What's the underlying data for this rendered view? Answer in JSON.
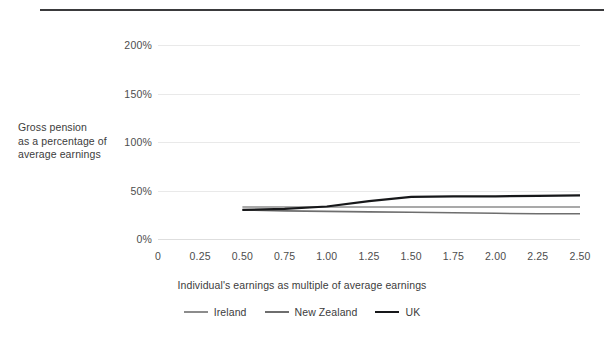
{
  "chart_data": {
    "type": "line",
    "title": "",
    "xlabel": "Individual's earnings as multiple of average earnings",
    "ylabel": "Gross pension as a percentage of average earnings",
    "xlim": [
      0,
      2.5
    ],
    "ylim": [
      0,
      200
    ],
    "x_ticks": [
      "0",
      "0.25",
      "0.50",
      "0.75",
      "1.00",
      "1.25",
      "1.50",
      "1.75",
      "2.00",
      "2.25",
      "2.50"
    ],
    "x_tick_values": [
      0,
      0.25,
      0.5,
      0.75,
      1.0,
      1.25,
      1.5,
      1.75,
      2.0,
      2.25,
      2.5
    ],
    "y_ticks": [
      "0%",
      "50%",
      "100%",
      "150%",
      "200%"
    ],
    "y_tick_values": [
      0,
      50,
      100,
      150,
      200
    ],
    "grid": "horizontal",
    "legend_position": "bottom",
    "x": [
      0.5,
      0.75,
      1.0,
      1.25,
      1.5,
      1.75,
      2.0,
      2.25,
      2.5
    ],
    "series": [
      {
        "name": "Ireland",
        "color": "#8c8c8c",
        "width": 1.6,
        "values": [
          33,
          33,
          33,
          33,
          33,
          33,
          33,
          33,
          33
        ]
      },
      {
        "name": "New Zealand",
        "color": "#6e6e6e",
        "width": 1.6,
        "values": [
          30,
          29,
          28.5,
          28,
          27.5,
          27,
          26.5,
          26,
          26
        ]
      },
      {
        "name": "UK",
        "color": "#17181a",
        "width": 2.2,
        "values": [
          30,
          31,
          33.5,
          39,
          43.5,
          44,
          44,
          44.5,
          45
        ]
      }
    ]
  },
  "axis": {
    "y_title_lines": [
      "Gross pension",
      "as a percentage of",
      "average earnings"
    ],
    "x_title": "Individual's earnings as multiple of average earnings"
  },
  "legend": {
    "items": [
      {
        "label": "Ireland"
      },
      {
        "label": "New Zealand"
      },
      {
        "label": "UK"
      }
    ]
  }
}
